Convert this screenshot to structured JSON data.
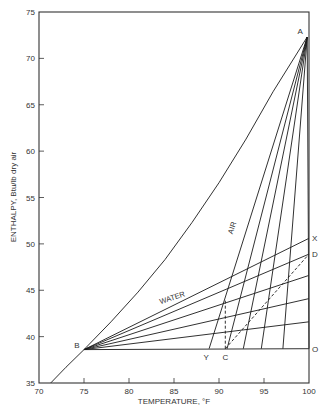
{
  "chart_data": {
    "type": "line",
    "title": "",
    "xlabel": "TEMPERATURE, °F",
    "ylabel": "ENTHALPY, Btu/lb dry air",
    "xlim": [
      70,
      100
    ],
    "ylim": [
      35,
      75
    ],
    "xticks": [
      70,
      75,
      80,
      85,
      90,
      95,
      100
    ],
    "yticks": [
      35,
      40,
      45,
      50,
      55,
      60,
      65,
      70,
      75
    ],
    "grid": false,
    "points": {
      "A": [
        99.8,
        72.3
      ],
      "B": [
        75,
        38.6
      ],
      "C": [
        90.7,
        38.7
      ],
      "D": [
        100,
        48.9
      ],
      "O": [
        100,
        38.7
      ],
      "X": [
        100,
        50.6
      ],
      "Y": [
        88.9,
        38.7
      ]
    },
    "series": [
      {
        "name": "Saturation curve",
        "style": "solid",
        "x": [
          71.3,
          73,
          75,
          78,
          81,
          84,
          87,
          90,
          93,
          96,
          99.8
        ],
        "y": [
          35,
          36.7,
          38.6,
          41.6,
          44.8,
          48.3,
          52.3,
          56.6,
          61.3,
          66.4,
          72.3
        ]
      },
      {
        "name": "Operating line B-O",
        "style": "solid",
        "x": [
          75,
          100
        ],
        "y": [
          38.6,
          38.7
        ]
      },
      {
        "name": "Water line 1 (B-X)",
        "label": "WATER",
        "style": "solid",
        "x": [
          75,
          100
        ],
        "y": [
          38.6,
          50.6
        ]
      },
      {
        "name": "Water line 2 (B-D)",
        "style": "solid",
        "x": [
          75,
          100
        ],
        "y": [
          38.6,
          48.9
        ]
      },
      {
        "name": "Water line 3",
        "style": "solid",
        "x": [
          75,
          100
        ],
        "y": [
          38.6,
          46.6
        ]
      },
      {
        "name": "Water line 4",
        "style": "solid",
        "x": [
          75,
          100
        ],
        "y": [
          38.6,
          44.1
        ]
      },
      {
        "name": "Water line 5",
        "style": "solid",
        "x": [
          75,
          100
        ],
        "y": [
          38.6,
          41.6
        ]
      },
      {
        "name": "Air line 1 (Y-A)",
        "label": "AIR",
        "style": "solid",
        "x": [
          88.9,
          99.8
        ],
        "y": [
          38.7,
          72.3
        ]
      },
      {
        "name": "Air line 2",
        "style": "solid",
        "x": [
          90.9,
          99.8
        ],
        "y": [
          38.7,
          72.3
        ]
      },
      {
        "name": "Air line 3",
        "style": "solid",
        "x": [
          92.7,
          99.8
        ],
        "y": [
          38.7,
          72.3
        ]
      },
      {
        "name": "Air line 4",
        "style": "solid",
        "x": [
          94.7,
          99.8
        ],
        "y": [
          38.7,
          72.3
        ]
      },
      {
        "name": "Air line 5",
        "style": "solid",
        "x": [
          97.1,
          99.8
        ],
        "y": [
          38.7,
          72.3
        ]
      },
      {
        "name": "Air line 6 (O-A)",
        "style": "solid",
        "x": [
          100,
          99.8
        ],
        "y": [
          38.7,
          72.3
        ]
      },
      {
        "name": "Dashed C-D",
        "style": "dashed",
        "x": [
          90.7,
          100
        ],
        "y": [
          38.7,
          48.9
        ]
      },
      {
        "name": "Dashed vertical C",
        "style": "dashed",
        "x": [
          90.7,
          90.7
        ],
        "y": [
          38.7,
          44.0
        ]
      }
    ],
    "annotations": [
      {
        "text": "A",
        "x": 99.8,
        "y": 72.3
      },
      {
        "text": "B",
        "x": 75,
        "y": 38.6
      },
      {
        "text": "C",
        "x": 90.7,
        "y": 38.7
      },
      {
        "text": "D",
        "x": 100,
        "y": 48.9
      },
      {
        "text": "O",
        "x": 100,
        "y": 38.7
      },
      {
        "text": "X",
        "x": 100,
        "y": 50.6
      },
      {
        "text": "Y",
        "x": 88.9,
        "y": 38.7
      },
      {
        "text": "AIR",
        "x": 91.5,
        "y": 51
      },
      {
        "text": "WATER",
        "x": 83.5,
        "y": 43.5
      }
    ]
  },
  "axis": {
    "x_title": "TEMPERATURE, °F",
    "y_title": "ENTHALPY, Btu/lb dry air"
  },
  "style": {
    "line_color": "#1a1a1a",
    "axis_color": "#333333",
    "text_color": "#333333",
    "background": "#ffffff"
  }
}
